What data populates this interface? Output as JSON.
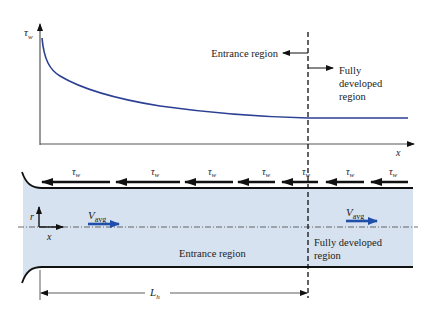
{
  "plot": {
    "y_label": "τ",
    "y_label_sub": "w",
    "x_label": "x",
    "curve_color": "#2b3f93"
  },
  "regions": {
    "entrance_label": "Entrance region",
    "fully_developed_lines": [
      "Fully",
      "developed",
      "region"
    ]
  },
  "pipe": {
    "fill_color": "#d6e2ef",
    "shear_label": "τ",
    "shear_sub": "w",
    "shear_count": 8,
    "velocity_label": "V",
    "velocity_sub": "avg",
    "velocity_color": "#1f4fa8",
    "axis_r": "r",
    "axis_x": "x",
    "entrance_region_label": "Entrance region",
    "fully_developed_lines": [
      "Fully developed",
      "region"
    ]
  },
  "dimension": {
    "label": "L",
    "label_sub": "h"
  }
}
